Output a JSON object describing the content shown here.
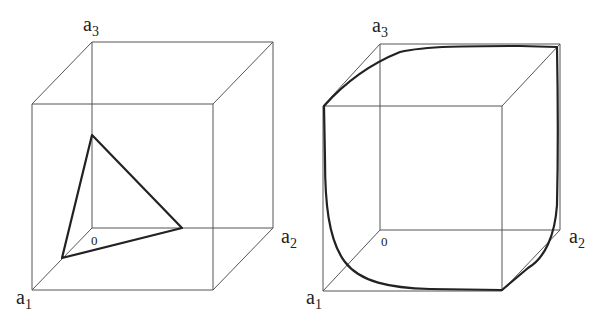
{
  "figure": {
    "panels": [
      {
        "id": "left",
        "description": "Unit cube with simplex (triangle) connecting points on the three axes",
        "labels": {
          "a1": {
            "base": "a",
            "sub": "1"
          },
          "a2": {
            "base": "a",
            "sub": "2"
          },
          "a3": {
            "base": "a",
            "sub": "3"
          },
          "origin": "0"
        },
        "shape": "triangle"
      },
      {
        "id": "right",
        "description": "Unit cube with a closed curve approaching the cube edges (limit shape)",
        "labels": {
          "a1": {
            "base": "a",
            "sub": "1"
          },
          "a2": {
            "base": "a",
            "sub": "2"
          },
          "a3": {
            "base": "a",
            "sub": "3"
          },
          "origin": "0"
        },
        "shape": "rounded-curve"
      }
    ],
    "colors": {
      "edge": "#555555",
      "shape": "#222222",
      "background": "#ffffff"
    }
  }
}
